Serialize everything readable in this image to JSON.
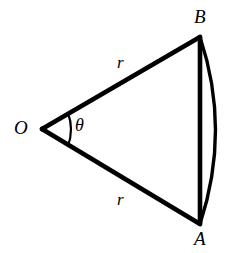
{
  "figure": {
    "background_color": "#ffffff",
    "stroke_color": "#000000",
    "width": 238,
    "height": 253
  },
  "labels": {
    "center_vertex": "O",
    "arc_endpoint_top": "B",
    "arc_endpoint_bottom": "A",
    "radius_upper": "r",
    "radius_lower": "r",
    "central_angle": "θ"
  },
  "geometry": {
    "center_point": {
      "x": 42,
      "y": 129
    },
    "point_B": {
      "x": 200,
      "y": 37
    },
    "point_A": {
      "x": 200,
      "y": 224
    },
    "chord_x": 200,
    "arc_bulge_x": 223,
    "arc_mid_y": 130,
    "angle_arc_radius": 28,
    "radius_stroke_width": 4.5,
    "chord_stroke_width": 4.5,
    "arc_stroke_width": 3.4,
    "angle_arc_stroke_width": 2.2
  }
}
